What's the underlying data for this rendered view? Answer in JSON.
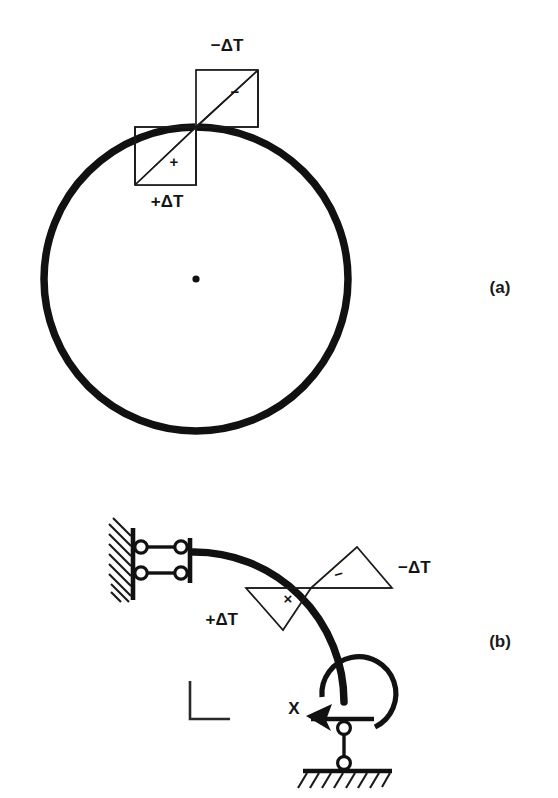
{
  "figure": {
    "title_a": "(a)",
    "title_b": "(b)",
    "panels": [
      {
        "key": "a",
        "label": "(a)",
        "description": "closed circular ring with temperature gradient bowtie diagram at crown",
        "shape": "circle",
        "center_marker": "center-dot",
        "temperature_diagram": {
          "type": "bowtie",
          "upper_label": "−ΔT",
          "lower_label": "+ΔT",
          "upper_sign": "−",
          "lower_sign": "+"
        }
      },
      {
        "key": "b",
        "label": "(b)",
        "description": "quarter circular arch, roller support at left end, pin support at base, redundant moment X",
        "shape": "quarter-arc",
        "temperature_diagram": {
          "type": "bowtie-rotated",
          "upper_label": "−ΔT",
          "lower_label": "+ΔT",
          "upper_sign": "−",
          "lower_sign": "×"
        },
        "supports": {
          "left": "double-roller-wall",
          "bottom": "pin-on-hatched-ground"
        },
        "redundant_force": {
          "label": "X",
          "type": "moment",
          "direction": "counterclockwise"
        },
        "axis_marker": "L-shaped-axis"
      }
    ],
    "colors": {
      "ink": "#111111",
      "background": "#ffffff"
    }
  }
}
